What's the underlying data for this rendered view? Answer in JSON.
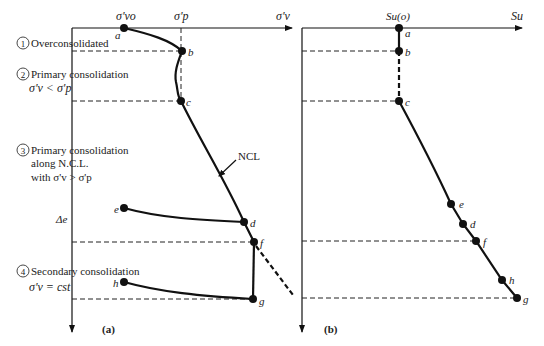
{
  "panel_a": {
    "caption": "(a)",
    "x_axis_label": "σ'v",
    "tick_vo": "σ'vo",
    "tick_p": "σ'p",
    "curve_label": "NCL",
    "delta_label": "Δe",
    "points": {
      "a": {
        "label": "a",
        "x": 124,
        "y": 28
      },
      "b": {
        "label": "b",
        "x": 182,
        "y": 51
      },
      "c": {
        "label": "c",
        "x": 181,
        "y": 101
      },
      "d": {
        "label": "d",
        "x": 244,
        "y": 222
      },
      "e": {
        "label": "e",
        "x": 124,
        "y": 208
      },
      "f": {
        "label": "f",
        "x": 254,
        "y": 242
      },
      "g": {
        "label": "g",
        "x": 253,
        "y": 299
      },
      "h": {
        "label": "h",
        "x": 124,
        "y": 282
      }
    }
  },
  "panel_b": {
    "caption": "(b)",
    "x_axis_label": "Su",
    "tick_o": "Su(o)",
    "points": {
      "a": {
        "label": "a",
        "x": 399,
        "y": 28
      },
      "b": {
        "label": "b",
        "x": 399,
        "y": 51
      },
      "c": {
        "label": "c",
        "x": 399,
        "y": 101
      },
      "e": {
        "label": "e",
        "x": 451,
        "y": 204
      },
      "d": {
        "label": "d",
        "x": 463,
        "y": 224
      },
      "f": {
        "label": "f",
        "x": 476,
        "y": 241
      },
      "h": {
        "label": "h",
        "x": 502,
        "y": 280
      },
      "g": {
        "label": "g",
        "x": 517,
        "y": 298
      }
    }
  },
  "stages": [
    {
      "num": "1",
      "title": "Overconsolidated",
      "lines": []
    },
    {
      "num": "2",
      "title": "Primary consolidation",
      "lines": [
        "σ'v < σ'p"
      ]
    },
    {
      "num": "3",
      "title": "Primary consolidation",
      "lines": [
        "along N.C.L.",
        "with σ'v > σ'p"
      ]
    },
    {
      "num": "4",
      "title": "Secondary consolidation",
      "lines": [
        "σ'v = cst"
      ]
    }
  ]
}
